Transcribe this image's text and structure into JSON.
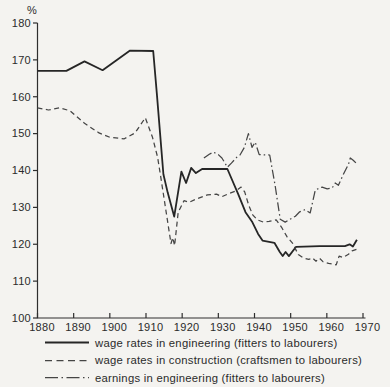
{
  "chart_data": {
    "type": "line",
    "title": "",
    "ylabel": "%",
    "xlabel": "",
    "ylim": [
      100,
      180
    ],
    "xlim": [
      1880,
      1970
    ],
    "yticks": [
      100,
      110,
      120,
      130,
      140,
      150,
      160,
      170,
      180
    ],
    "xticks": [
      1880,
      1890,
      1900,
      1910,
      1920,
      1930,
      1940,
      1950,
      1960,
      1970
    ],
    "grid": false,
    "legend_position": "bottom",
    "line_color": "#3c3c3c",
    "points_format": [
      "year",
      "percent"
    ],
    "series": [
      {
        "name": "wage rates in engineering (fitters to labourers)",
        "style": "solid",
        "points": [
          [
            1880,
            167
          ],
          [
            1888,
            167
          ],
          [
            1893,
            169.6
          ],
          [
            1898,
            167.2
          ],
          [
            1905.5,
            172.5
          ],
          [
            1912,
            172.4
          ],
          [
            1913,
            161
          ],
          [
            1914.8,
            139
          ],
          [
            1916,
            134
          ],
          [
            1917.8,
            127.5
          ],
          [
            1919.8,
            139.7
          ],
          [
            1921.1,
            136.6
          ],
          [
            1922.5,
            140.7
          ],
          [
            1923.8,
            139.3
          ],
          [
            1925.5,
            140.4
          ],
          [
            1932.5,
            140.4
          ],
          [
            1935.5,
            133.6
          ],
          [
            1937.5,
            128.7
          ],
          [
            1939.4,
            126
          ],
          [
            1941,
            122.8
          ],
          [
            1942.2,
            121
          ],
          [
            1945.5,
            120.4
          ],
          [
            1947,
            117.9
          ],
          [
            1947.8,
            116.8
          ],
          [
            1948.6,
            117.9
          ],
          [
            1949.5,
            116.8
          ],
          [
            1951.5,
            119.3
          ],
          [
            1958,
            119.5
          ],
          [
            1965,
            119.5
          ],
          [
            1966.3,
            120
          ],
          [
            1967.2,
            119.4
          ],
          [
            1968.3,
            121.2
          ]
        ]
      },
      {
        "name": "wage rates in construction (craftsmen to labourers)",
        "style": "dashed",
        "points": [
          [
            1880,
            157
          ],
          [
            1883,
            156.4
          ],
          [
            1886,
            157
          ],
          [
            1889,
            156.2
          ],
          [
            1893,
            152.8
          ],
          [
            1897,
            150.2
          ],
          [
            1900,
            149
          ],
          [
            1904,
            148.6
          ],
          [
            1907,
            150.2
          ],
          [
            1909.8,
            154.3
          ],
          [
            1911.8,
            149
          ],
          [
            1913.2,
            143.6
          ],
          [
            1914,
            138.7
          ],
          [
            1916.9,
            120.2
          ],
          [
            1917.4,
            121.8
          ],
          [
            1917.9,
            119.6
          ],
          [
            1918.9,
            128.7
          ],
          [
            1920.5,
            131.8
          ],
          [
            1922,
            131.4
          ],
          [
            1924,
            132.3
          ],
          [
            1927,
            133.4
          ],
          [
            1929.5,
            133.6
          ],
          [
            1931,
            132.9
          ],
          [
            1933,
            133.8
          ],
          [
            1934.8,
            134.4
          ],
          [
            1936.3,
            135.5
          ],
          [
            1937.3,
            134.2
          ],
          [
            1938.4,
            130.6
          ],
          [
            1939.5,
            128
          ],
          [
            1940.8,
            126.6
          ],
          [
            1942.5,
            126
          ],
          [
            1944,
            126.2
          ],
          [
            1946,
            126.6
          ],
          [
            1947.5,
            124.6
          ],
          [
            1949,
            122
          ],
          [
            1950.5,
            120.3
          ],
          [
            1952.1,
            117.2
          ],
          [
            1953.5,
            116.3
          ],
          [
            1955,
            115.9
          ],
          [
            1956,
            116.3
          ],
          [
            1957,
            115.4
          ],
          [
            1958,
            116.2
          ],
          [
            1959,
            115.2
          ],
          [
            1960.5,
            114.8
          ],
          [
            1961.8,
            114.6
          ],
          [
            1962.6,
            114.4
          ],
          [
            1963.4,
            116.8
          ],
          [
            1964.5,
            116.4
          ],
          [
            1966,
            117.3
          ],
          [
            1967,
            118.2
          ],
          [
            1968.4,
            118.7
          ]
        ]
      },
      {
        "name": "earnings in engineering (fitters to labourers)",
        "style": "dashdot",
        "points": [
          [
            1926,
            143.4
          ],
          [
            1927.5,
            144.4
          ],
          [
            1928.6,
            145
          ],
          [
            1930,
            144.3
          ],
          [
            1931,
            143.4
          ],
          [
            1932.5,
            140.9
          ],
          [
            1933.6,
            142
          ],
          [
            1935,
            143.5
          ],
          [
            1936,
            144.2
          ],
          [
            1937.2,
            146.3
          ],
          [
            1938.3,
            150
          ],
          [
            1939.3,
            146.3
          ],
          [
            1940.2,
            147.7
          ],
          [
            1941.3,
            144.3
          ],
          [
            1944.2,
            144.2
          ],
          [
            1945.7,
            136
          ],
          [
            1947.1,
            126.8
          ],
          [
            1948.5,
            126
          ],
          [
            1951.3,
            127.6
          ],
          [
            1952.5,
            128.8
          ],
          [
            1954,
            129.4
          ],
          [
            1955.4,
            128.5
          ],
          [
            1956.8,
            134.7
          ],
          [
            1958.7,
            135.5
          ],
          [
            1960.1,
            135
          ],
          [
            1961.5,
            135.3
          ],
          [
            1962.3,
            136.6
          ],
          [
            1963.2,
            136
          ],
          [
            1964.5,
            138.8
          ],
          [
            1966,
            141.7
          ],
          [
            1966.5,
            143.4
          ],
          [
            1967.3,
            142.8
          ],
          [
            1968.4,
            141.7
          ]
        ]
      }
    ]
  },
  "colors": {
    "background": "#f4f3f0",
    "axis": "#2e2e2e",
    "text": "#2b2b2b",
    "solid_line": "#262626",
    "broken_lines": "#454545"
  }
}
